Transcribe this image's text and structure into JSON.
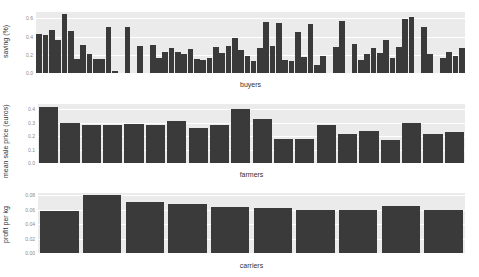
{
  "chart_data": [
    {
      "type": "bar",
      "title": "",
      "xlabel": "buyers",
      "ylabel": "saving (%)",
      "yticks": [
        "0.0",
        "0.2",
        "0.4",
        "0.6"
      ],
      "ylim": [
        0,
        0.67
      ],
      "grid": true,
      "values": [
        0.43,
        0.42,
        0.47,
        0.36,
        0.65,
        0.46,
        0.15,
        0.31,
        0.21,
        0.15,
        0.15,
        0.5,
        0.02,
        0,
        0.5,
        0,
        0.3,
        0,
        0.31,
        0.17,
        0.23,
        0.27,
        0.23,
        0.21,
        0.26,
        0.15,
        0.14,
        0.16,
        0.29,
        0.22,
        0.3,
        0.39,
        0.25,
        0.19,
        0.13,
        0.28,
        0.56,
        0.3,
        0.55,
        0.14,
        0.13,
        0.45,
        0.18,
        0.54,
        0.09,
        0.19,
        0,
        0.29,
        0.57,
        0,
        0.32,
        0.14,
        0.21,
        0.27,
        0.22,
        0.36,
        0.17,
        0.29,
        0.59,
        0.61,
        0,
        0.51,
        0.21,
        0,
        0.16,
        0.23,
        0.19,
        0.27
      ]
    },
    {
      "type": "bar",
      "title": "",
      "xlabel": "farmers",
      "ylabel": "mean sale price (euros)",
      "yticks": [
        "0.0",
        "0.1",
        "0.2",
        "0.3",
        "0.4"
      ],
      "ylim": [
        0,
        0.44
      ],
      "grid": true,
      "values": [
        0.42,
        0.3,
        0.28,
        0.28,
        0.29,
        0.28,
        0.31,
        0.26,
        0.28,
        0.4,
        0.33,
        0.18,
        0.18,
        0.28,
        0.22,
        0.24,
        0.17,
        0.3,
        0.22,
        0.23
      ]
    },
    {
      "type": "bar",
      "title": "",
      "xlabel": "carriers",
      "ylabel": "profit per kg",
      "yticks": [
        "0.00",
        "0.02",
        "0.04",
        "0.06",
        "0.08"
      ],
      "ylim": [
        0,
        0.083
      ],
      "grid": true,
      "values": [
        0.058,
        0.08,
        0.071,
        0.068,
        0.063,
        0.062,
        0.06,
        0.06,
        0.065,
        0.06
      ]
    }
  ],
  "colors": {
    "bar": "#3a3a3a",
    "panel": "#ebebeb",
    "grid": "#ffffff",
    "tick": "#8a8a8a"
  },
  "panels": [
    {
      "xlabel": "buyers",
      "ylabel": "saving (%)"
    },
    {
      "xlabel": "farmers",
      "ylabel": "mean sale price (euros)"
    },
    {
      "xlabel": "carriers",
      "ylabel": "profit per kg"
    }
  ]
}
